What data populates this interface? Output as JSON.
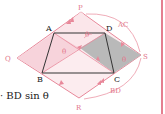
{
  "diagram": {
    "points": {
      "A": "A",
      "B": "B",
      "C": "C",
      "D": "D",
      "P": "P",
      "Q": "Q",
      "R": "R",
      "S": "S"
    },
    "arc_labels": {
      "ac": "AC",
      "bd": "BD"
    },
    "angle_labels": {
      "theta_top": "θ",
      "theta_left": "θ",
      "theta_right": "θ"
    },
    "colors": {
      "pink_fill": "#f9dce2",
      "pink_line": "#e8889a",
      "gray_fill": "#b9b9b9",
      "quad_line": "#333333",
      "border": "#e47f90"
    }
  },
  "formula": {
    "text": "· BD sin θ"
  }
}
